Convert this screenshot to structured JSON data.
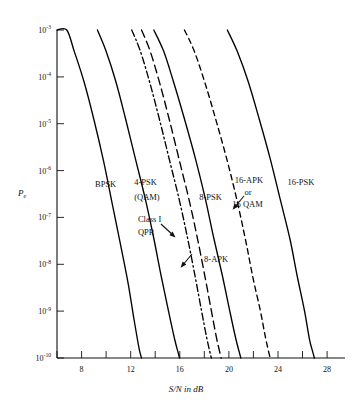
{
  "chart_data": {
    "type": "line",
    "title": "",
    "xlabel": "S/N in dB",
    "ylabel": "Pe",
    "ylabel_base": "P",
    "ylabel_sub": "e",
    "xlim": [
      6,
      29.5
    ],
    "ylim_exponents": [
      -10,
      -3
    ],
    "yscale": "log",
    "grid": false,
    "legend": "inline-labels",
    "x_ticks_major": [
      8,
      12,
      16,
      20,
      24,
      28
    ],
    "x_ticks_minor": [
      6,
      10,
      14,
      18,
      22,
      26
    ],
    "x_tick_labels": [
      "8",
      "12",
      "16",
      "20",
      "24",
      "28"
    ],
    "y_ticks": [
      {
        "mantissa": "10",
        "exponent": "-3"
      },
      {
        "mantissa": "10",
        "exponent": "-4"
      },
      {
        "mantissa": "10",
        "exponent": "-5"
      },
      {
        "mantissa": "10",
        "exponent": "-6"
      },
      {
        "mantissa": "10",
        "exponent": "-7"
      },
      {
        "mantissa": "10",
        "exponent": "-8"
      },
      {
        "mantissa": "10",
        "exponent": "-9"
      },
      {
        "mantissa": "10",
        "exponent": "-10"
      }
    ],
    "series": [
      {
        "name": "BPSK",
        "style": "solid",
        "x": [
          6.0,
          6.8,
          7.4,
          8.2,
          9.0,
          9.8,
          10.5,
          11.2,
          11.8,
          12.3,
          12.7,
          12.9
        ],
        "y_exponents": [
          -3.0,
          -3.0,
          -3.45,
          -4.1,
          -4.9,
          -5.8,
          -6.7,
          -7.6,
          -8.4,
          -9.2,
          -9.8,
          -10.0
        ]
      },
      {
        "name": "4-PSK (QAM)",
        "label_lines": [
          "4-PSK",
          "(QAM)"
        ],
        "style": "solid",
        "x": [
          9.3,
          10.0,
          10.8,
          11.6,
          12.4,
          13.2,
          13.9,
          14.5,
          15.1,
          15.6,
          15.9,
          16.0
        ],
        "y_exponents": [
          -3.0,
          -3.45,
          -4.1,
          -4.9,
          -5.75,
          -6.6,
          -7.45,
          -8.25,
          -9.0,
          -9.6,
          -9.9,
          -10.0
        ]
      },
      {
        "name": "Class I QPR",
        "label_lines": [
          "Class I",
          "QPR"
        ],
        "style": "dashdot",
        "x": [
          12.1,
          12.8,
          13.6,
          14.4,
          15.2,
          16.0,
          16.7,
          17.3,
          17.8,
          18.2,
          18.5,
          18.6
        ],
        "y_exponents": [
          -3.0,
          -3.45,
          -4.15,
          -4.95,
          -5.8,
          -6.65,
          -7.5,
          -8.3,
          -9.0,
          -9.55,
          -9.9,
          -10.0
        ]
      },
      {
        "name": "8-APK",
        "style": "longdash",
        "x": [
          12.9,
          13.6,
          14.4,
          15.2,
          16.0,
          16.8,
          17.5,
          18.1,
          18.6,
          19.0,
          19.3,
          19.4
        ],
        "y_exponents": [
          -3.0,
          -3.45,
          -4.15,
          -4.95,
          -5.8,
          -6.65,
          -7.5,
          -8.3,
          -9.0,
          -9.55,
          -9.9,
          -10.0
        ]
      },
      {
        "name": "8-PSK",
        "style": "solid",
        "x": [
          13.9,
          14.7,
          15.5,
          16.4,
          17.3,
          18.1,
          18.8,
          19.5,
          20.1,
          20.6,
          20.9,
          21.0
        ],
        "y_exponents": [
          -3.0,
          -3.45,
          -4.1,
          -4.9,
          -5.75,
          -6.6,
          -7.45,
          -8.25,
          -9.0,
          -9.6,
          -9.9,
          -10.0
        ]
      },
      {
        "name": "16-APK or 16 QAM",
        "label_lines": [
          "16-APK",
          "or",
          "16 QAM"
        ],
        "style": "dashed",
        "x": [
          16.4,
          17.2,
          18.1,
          19.0,
          19.9,
          20.7,
          21.4,
          22.0,
          22.6,
          23.0,
          23.3,
          23.4
        ],
        "y_exponents": [
          -3.0,
          -3.45,
          -4.15,
          -4.95,
          -5.8,
          -6.65,
          -7.5,
          -8.3,
          -9.0,
          -9.55,
          -9.9,
          -10.0
        ]
      },
      {
        "name": "16-PSK",
        "style": "solid",
        "x": [
          19.9,
          20.7,
          21.6,
          22.5,
          23.4,
          24.2,
          25.0,
          25.6,
          26.2,
          26.6,
          26.9,
          27.0
        ],
        "y_exponents": [
          -3.0,
          -3.45,
          -4.1,
          -4.9,
          -5.75,
          -6.6,
          -7.45,
          -8.25,
          -9.0,
          -9.6,
          -9.9,
          -10.0
        ]
      }
    ],
    "annotations": [
      {
        "text": "BPSK",
        "x": 9.1,
        "y_exponent": -6.35
      },
      {
        "text": "4-PSK",
        "x": 12.3,
        "y_exponent": -6.3
      },
      {
        "text": "(QAM)",
        "x": 12.3,
        "y_exponent": -6.62
      },
      {
        "text": "Class I",
        "x": 12.6,
        "y_exponent": -7.1
      },
      {
        "text": "QPR",
        "x": 12.6,
        "y_exponent": -7.38
      },
      {
        "text": "8-APK",
        "x": 18.0,
        "y_exponent": -7.95
      },
      {
        "text": "8-PSK",
        "x": 17.6,
        "y_exponent": -6.62
      },
      {
        "text": "16-APK",
        "x": 20.5,
        "y_exponent": -6.27
      },
      {
        "text": "or",
        "x": 21.3,
        "y_exponent": -6.53
      },
      {
        "text": "16 QAM",
        "x": 20.3,
        "y_exponent": -6.78
      },
      {
        "text": "16-PSK",
        "x": 24.8,
        "y_exponent": -6.3
      }
    ]
  },
  "figure": {
    "xaxis_title": "S/N in dB",
    "xaxis_title_parts": {
      "slashed": "S/N",
      "suffix": " in dB"
    },
    "yaxis_title": "Pe"
  }
}
